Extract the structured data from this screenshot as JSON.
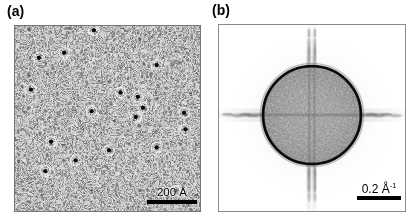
{
  "figure": {
    "type": "two-panel scientific micrograph figure",
    "background_color": "#ffffff",
    "width": 417,
    "height": 222
  },
  "panels": [
    {
      "id": "a",
      "label": "(a)",
      "kind": "real-space-grayscale-image",
      "description": "labyrinthine stripe-domain texture with dark point defects",
      "x": 14,
      "y": 25,
      "width": 187,
      "height": 187,
      "mean_gray": "#8d8d8d",
      "border_color": "#777777",
      "texture": {
        "pattern": "labyrinth",
        "period_px": 7.5,
        "contrast": 0.55,
        "light_gray": "#e8e8e8",
        "dark_gray": "#2e2e2e"
      },
      "defects": {
        "count": 18,
        "fill_color": "#0a0a0a",
        "halo_color": "#f2f2f2",
        "radius_px": 3.4,
        "points": [
          [
            109,
            6
          ],
          [
            33,
            44
          ],
          [
            68,
            37
          ],
          [
            196,
            54
          ],
          [
            146,
            92
          ],
          [
            170,
            98
          ],
          [
            177,
            113
          ],
          [
            22,
            88
          ],
          [
            167,
            126
          ],
          [
            234,
            120
          ],
          [
            236,
            143
          ],
          [
            50,
            160
          ],
          [
            130,
            172
          ],
          [
            84,
            186
          ],
          [
            42,
            201
          ],
          [
            222,
            228
          ],
          [
            106,
            118
          ],
          [
            196,
            168
          ]
        ]
      },
      "scalebar": {
        "text": "200 Å",
        "bar_length_px": 50,
        "bar_color": "#000000",
        "position": "bottom-right"
      }
    },
    {
      "id": "b",
      "label": "(b)",
      "kind": "fourier-transform-power-spectrum",
      "description": "2D FFT showing a filled low-frequency disk with a sharp dark ring edge plus horizontal and vertical streak artifacts",
      "x": 218,
      "y": 24,
      "width": 188,
      "height": 188,
      "background_color": "#ffffff",
      "border_color": "#8a8a8a",
      "disk": {
        "center_x": 95,
        "center_y": 92,
        "radius_px": 50,
        "fill_color": "#8f8f8f",
        "edge_ring_color": "#1a1a1a",
        "edge_ring_width_px": 3
      },
      "streaks": {
        "horizontal_color": "#6f6f6f",
        "vertical_color": "#6f6f6f",
        "vertical_split_offset_px": 5,
        "extent": "full-panel"
      },
      "scalebar": {
        "text_value": "0.2",
        "text_unit": "Å",
        "text_exponent": "-1",
        "text_full": "0.2 Å⁻¹",
        "bar_length_px": 44,
        "bar_color": "#000000",
        "position": "bottom-right"
      }
    }
  ],
  "chart_data": {
    "type": "heatmap",
    "title": "",
    "subtitle": "",
    "panels": [
      {
        "name": "(a) real-space image",
        "xlabel": "",
        "ylabel": "",
        "colormap": "grayscale",
        "scale_bar_length": "200 Å",
        "feature_counts": {
          "dark_defects": 18
        },
        "notes": "labyrinthine / worm-like stripe domains, period approximately 25 angstrom"
      },
      {
        "name": "(b) Fourier transform",
        "xlabel": "",
        "ylabel": "",
        "colormap": "inverted grayscale",
        "scale_bar_length": "0.2 Å⁻¹",
        "radial_features": {
          "disk_radius_inverse_angstrom": 0.23,
          "ring_edge": "sharp dark annulus at disk boundary"
        },
        "notes": "isotropic ring indicates no preferred in-plane orientation; cross streaks are scan/window artifacts"
      }
    ]
  }
}
